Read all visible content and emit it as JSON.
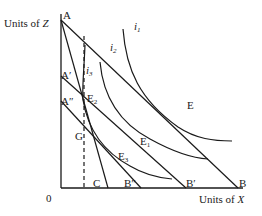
{
  "diagram": {
    "axes": {
      "y_label": "Units of Z",
      "y_label_var": "Z",
      "y_label_prefix": "Units of ",
      "x_label_prefix": "Units of ",
      "x_label_var": "X",
      "origin": "0"
    },
    "points": {
      "A": "A",
      "A_prime": "A′",
      "A_double_prime": "A″",
      "B": "B",
      "B_prime": "B′",
      "B_double_prime": "B″",
      "C": "C",
      "E": "E",
      "E1_base": "E",
      "E1_sub": "1",
      "E2_base": "E",
      "E2_sub": "2",
      "E3_base": "E",
      "E3_sub": "3",
      "G": "G"
    },
    "curves": {
      "i1_base": "i",
      "i1_sub": "1",
      "i2_base": "i",
      "i2_sub": "2",
      "i3_base": "i",
      "i3_sub": "3"
    },
    "budget_lines": [
      {
        "name": "AB",
        "from": "A",
        "to": "B"
      },
      {
        "name": "A'B'",
        "from": "A′",
        "to": "B′"
      },
      {
        "name": "A''B''",
        "from": "A″",
        "to": "B″"
      },
      {
        "name": "AC",
        "from": "A",
        "to": "C"
      }
    ],
    "indifference_curves": [
      {
        "name": "i1",
        "tangent_point": "E",
        "tangent_line": "AB"
      },
      {
        "name": "i2",
        "tangent_point": "E1",
        "tangent_line": "A'B'"
      },
      {
        "name": "i3",
        "tangent_points": [
          "E2",
          "E3"
        ],
        "tangent_lines": [
          "AC",
          "A''B''"
        ]
      }
    ],
    "dashed_vertical": {
      "through": [
        "E2",
        "G"
      ],
      "style": "dashed"
    },
    "colors": {
      "ink": "#1a1a1a",
      "background": "#ffffff"
    }
  }
}
